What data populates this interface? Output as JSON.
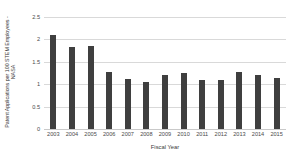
{
  "chart_data": {
    "type": "bar",
    "title": "",
    "xlabel": "Fiscal Year",
    "ylabel": "Patent Applications per 100 STEM Employees - NASA",
    "categories": [
      "2003",
      "2004",
      "2005",
      "2006",
      "2007",
      "2008",
      "2009",
      "2010",
      "2011",
      "2012",
      "2013",
      "2014",
      "2015"
    ],
    "values": [
      2.09,
      1.83,
      1.86,
      1.27,
      1.12,
      1.05,
      1.2,
      1.24,
      1.09,
      1.1,
      1.27,
      1.21,
      1.13
    ],
    "ylim": [
      0,
      2.5
    ],
    "yticks": [
      "0",
      "0.5",
      "1",
      "1.5",
      "2",
      "2.5"
    ],
    "ytick_values": [
      0,
      0.5,
      1,
      1.5,
      2,
      2.5
    ],
    "grid": true,
    "legend": "none",
    "bar_color": "#3F3F3F",
    "gridline_color": "#D9D9D9",
    "background_color": "#FFFFFF"
  }
}
